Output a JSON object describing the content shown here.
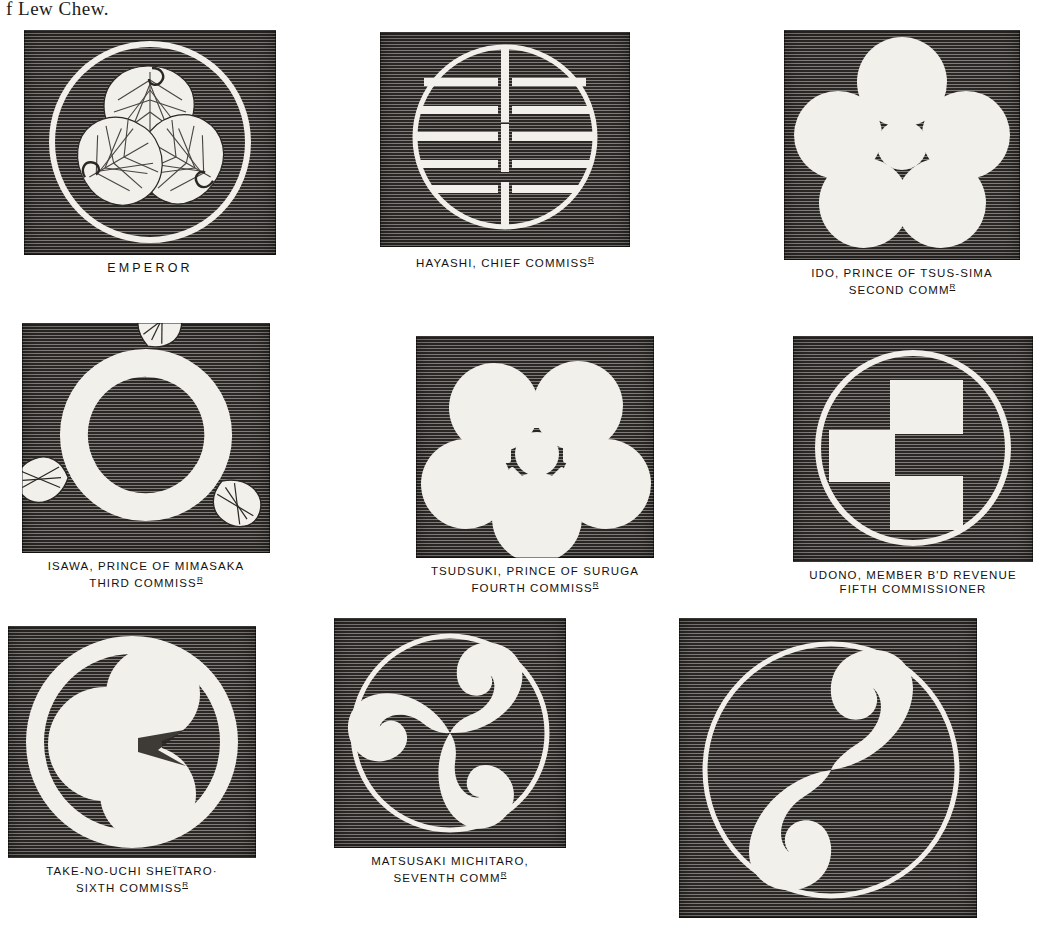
{
  "page": {
    "running_head": "f Lew Chew.",
    "background_color": "#ffffff",
    "block_color": "#2a2724",
    "device_color": "#f2f0ea"
  },
  "plate": {
    "crests": [
      {
        "id": "emperor",
        "device": "triple-hollyhock-in-ring",
        "caption_line1": "EMPEROR",
        "caption_line2": "",
        "caption_abbrev": "",
        "wide_spacing": true
      },
      {
        "id": "hayashi",
        "device": "barred-circle",
        "caption_line1": "HAYASHI, CHIEF COMMISS",
        "caption_line2": "",
        "caption_abbrev": "R",
        "wide_spacing": false
      },
      {
        "id": "ido",
        "device": "five-circles-plain-center",
        "caption_line1": "IDO, PRINCE OF TSUS-SIMA",
        "caption_line2": "SECOND COMM",
        "caption_abbrev": "R",
        "wide_spacing": false
      },
      {
        "id": "isawa",
        "device": "triple-wave-leaf",
        "caption_line1": "ISAWA, PRINCE OF MIMASAKA",
        "caption_line2": "THIRD COMMISS",
        "caption_abbrev": "R",
        "wide_spacing": false
      },
      {
        "id": "tsudsuki",
        "device": "five-circles-rosette-center",
        "caption_line1": "TSUDSUKI, PRINCE OF SURUGA",
        "caption_line2": "FOURTH COMMISS",
        "caption_abbrev": "R",
        "wide_spacing": false
      },
      {
        "id": "udono",
        "device": "three-bars-in-circle",
        "caption_line1": "UDONO, MEMBER B'D REVENUE",
        "caption_line2": "FIFTH COMMISSIONER",
        "caption_abbrev": "",
        "wide_spacing": false
      },
      {
        "id": "take-no-uchi",
        "device": "three-discs-in-ring",
        "caption_line1": "TAKE-NO-UCHI SHEÏTARO·",
        "caption_line2": "SIXTH COMMISS",
        "caption_abbrev": "R",
        "wide_spacing": false
      },
      {
        "id": "matsusaki",
        "device": "mitsudomoe-in-ring",
        "caption_line1": "MATSUSAKI MICHITARO,",
        "caption_line2": "SEVENTH COMM",
        "caption_abbrev": "R",
        "wide_spacing": false
      },
      {
        "id": "unlabelled",
        "device": "futatsudomoe-in-ring",
        "caption_line1": "",
        "caption_line2": "",
        "caption_abbrev": "",
        "wide_spacing": false
      }
    ]
  }
}
